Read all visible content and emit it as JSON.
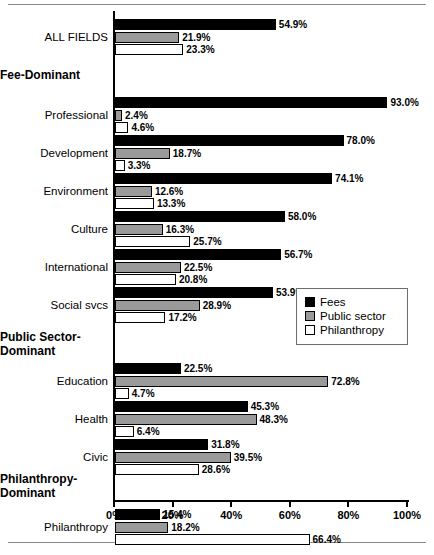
{
  "chart_data": {
    "type": "bar",
    "orientation": "horizontal",
    "title": "",
    "xlabel": "",
    "ylabel": "",
    "xlim": [
      0,
      100
    ],
    "xticks": [
      "0%",
      "20%",
      "40%",
      "60%",
      "80%",
      "100%"
    ],
    "xtick_values": [
      0,
      20,
      40,
      60,
      80,
      100
    ],
    "grid": false,
    "legend_position": "right-middle",
    "value_suffix": "%",
    "series": [
      {
        "name": "Fees",
        "color": "#000000",
        "values": [
          54.9,
          93.0,
          78.0,
          74.1,
          58.0,
          56.7,
          53.9,
          22.5,
          45.3,
          31.8,
          15.4
        ]
      },
      {
        "name": "Public sector",
        "color": "#9a9a9a",
        "values": [
          21.9,
          2.4,
          18.7,
          12.6,
          16.3,
          22.5,
          28.9,
          72.8,
          48.3,
          39.5,
          18.2
        ]
      },
      {
        "name": "Philanthropy",
        "color": "#ffffff",
        "values": [
          23.3,
          4.6,
          3.3,
          13.3,
          25.7,
          20.8,
          17.2,
          4.7,
          6.4,
          28.6,
          66.4
        ]
      }
    ],
    "categories": [
      "ALL FIELDS",
      "Professional",
      "Development",
      "Environment",
      "Culture",
      "International",
      "Social svcs",
      "Education",
      "Health",
      "Civic",
      "Philanthropy"
    ],
    "value_labels": [
      [
        "54.9%",
        "21.9%",
        "23.3%"
      ],
      [
        "93.0%",
        "2.4%",
        "4.6%"
      ],
      [
        "78.0%",
        "18.7%",
        "3.3%"
      ],
      [
        "74.1%",
        "12.6%",
        "13.3%"
      ],
      [
        "58.0%",
        "16.3%",
        "25.7%"
      ],
      [
        "56.7%",
        "22.5%",
        "20.8%"
      ],
      [
        "53.9%",
        "28.9%",
        "17.2%"
      ],
      [
        "22.5%",
        "72.8%",
        "4.7%"
      ],
      [
        "45.3%",
        "48.3%",
        "6.4%"
      ],
      [
        "31.8%",
        "39.5%",
        "28.6%"
      ],
      [
        "15.4%",
        "18.2%",
        "66.4%"
      ]
    ],
    "groups": [
      {
        "label": "Fee-Dominant",
        "members": [
          "Professional",
          "Development",
          "Environment",
          "Culture",
          "International",
          "Social svcs"
        ]
      },
      {
        "label": "Public Sector-Dominant",
        "members": [
          "Education",
          "Health",
          "Civic"
        ]
      },
      {
        "label": "Philanthropy-Dominant",
        "members": [
          "Philanthropy"
        ]
      }
    ]
  },
  "rows": [
    {
      "kind": "category",
      "label": "ALL FIELDS",
      "top": 8,
      "bars": [
        {
          "series": 0,
          "value": 54.9,
          "text": "54.9%"
        },
        {
          "series": 1,
          "value": 21.9,
          "text": "21.9%"
        },
        {
          "series": 2,
          "value": 23.3,
          "text": "23.3%"
        }
      ]
    },
    {
      "kind": "group",
      "label": "Fee-Dominant",
      "top": 58
    },
    {
      "kind": "category",
      "label": "Professional",
      "top": 86,
      "bars": [
        {
          "series": 0,
          "value": 93.0,
          "text": "93.0%"
        },
        {
          "series": 1,
          "value": 2.4,
          "text": "2.4%"
        },
        {
          "series": 2,
          "value": 4.6,
          "text": "4.6%"
        }
      ]
    },
    {
      "kind": "category",
      "label": "Development",
      "top": 124,
      "bars": [
        {
          "series": 0,
          "value": 78.0,
          "text": "78.0%"
        },
        {
          "series": 1,
          "value": 18.7,
          "text": "18.7%"
        },
        {
          "series": 2,
          "value": 3.3,
          "text": "3.3%"
        }
      ]
    },
    {
      "kind": "category",
      "label": "Environment",
      "top": 162,
      "bars": [
        {
          "series": 0,
          "value": 74.1,
          "text": "74.1%"
        },
        {
          "series": 1,
          "value": 12.6,
          "text": "12.6%"
        },
        {
          "series": 2,
          "value": 13.3,
          "text": "13.3%"
        }
      ]
    },
    {
      "kind": "category",
      "label": "Culture",
      "top": 200,
      "bars": [
        {
          "series": 0,
          "value": 58.0,
          "text": "58.0%"
        },
        {
          "series": 1,
          "value": 16.3,
          "text": "16.3%"
        },
        {
          "series": 2,
          "value": 25.7,
          "text": "25.7%"
        }
      ]
    },
    {
      "kind": "category",
      "label": "International",
      "top": 238,
      "bars": [
        {
          "series": 0,
          "value": 56.7,
          "text": "56.7%"
        },
        {
          "series": 1,
          "value": 22.5,
          "text": "22.5%"
        },
        {
          "series": 2,
          "value": 20.8,
          "text": "20.8%"
        }
      ]
    },
    {
      "kind": "category",
      "label": "Social svcs",
      "top": 276,
      "bars": [
        {
          "series": 0,
          "value": 53.9,
          "text": "53.9%"
        },
        {
          "series": 1,
          "value": 28.9,
          "text": "28.9%"
        },
        {
          "series": 2,
          "value": 17.2,
          "text": "17.2%"
        }
      ]
    },
    {
      "kind": "group",
      "label": "Public Sector-\nDominant",
      "top": 320
    },
    {
      "kind": "category",
      "label": "Education",
      "top": 352,
      "bars": [
        {
          "series": 0,
          "value": 22.5,
          "text": "22.5%"
        },
        {
          "series": 1,
          "value": 72.8,
          "text": "72.8%"
        },
        {
          "series": 2,
          "value": 4.7,
          "text": "4.7%"
        }
      ]
    },
    {
      "kind": "category",
      "label": "Health",
      "top": 390,
      "bars": [
        {
          "series": 0,
          "value": 45.3,
          "text": "45.3%"
        },
        {
          "series": 1,
          "value": 48.3,
          "text": "48.3%"
        },
        {
          "series": 2,
          "value": 6.4,
          "text": "6.4%"
        }
      ]
    },
    {
      "kind": "category",
      "label": "Civic",
      "top": 428,
      "bars": [
        {
          "series": 0,
          "value": 31.8,
          "text": "31.8%"
        },
        {
          "series": 1,
          "value": 39.5,
          "text": "39.5%"
        },
        {
          "series": 2,
          "value": 28.6,
          "text": "28.6%"
        }
      ]
    },
    {
      "kind": "group",
      "label": "Philanthropy-\nDominant",
      "top": 462
    },
    {
      "kind": "category",
      "label": "Philanthropy",
      "top": 498,
      "bars": [
        {
          "series": 0,
          "value": 15.4,
          "text": "15.4%"
        },
        {
          "series": 1,
          "value": 18.2,
          "text": "18.2%"
        },
        {
          "series": 2,
          "value": 66.4,
          "text": "66.4%"
        }
      ]
    }
  ],
  "axis": {
    "ticks": [
      "0%",
      "20%",
      "40%",
      "60%",
      "80%",
      "100%"
    ]
  },
  "legend": {
    "items": [
      {
        "label": "Fees",
        "swatch": "fees"
      },
      {
        "label": "Public sector",
        "swatch": "public"
      },
      {
        "label": "Philanthropy",
        "swatch": "phil"
      }
    ]
  }
}
